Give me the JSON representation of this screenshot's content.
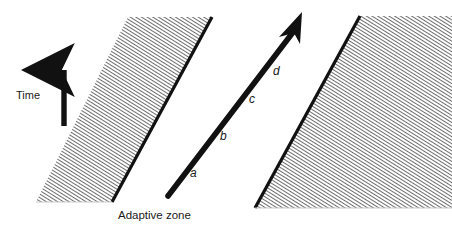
{
  "figure": {
    "background_color": "#ffffff",
    "ink_color": "#1a1a1a",
    "hatch_color": "#4d4d4d",
    "width": 452,
    "height": 233
  },
  "axis": {
    "time_label": "Time",
    "arrow_direction": "up"
  },
  "caption": {
    "adaptive_zone_label": "Adaptive zone"
  },
  "trajectory": {
    "arrow_direction": "up-right",
    "segments": [
      {
        "label": "a"
      },
      {
        "label": "b"
      },
      {
        "label": "c"
      },
      {
        "label": "d"
      }
    ]
  },
  "zones": [
    {
      "name": "left-hatched-band"
    },
    {
      "name": "right-hatched-band"
    }
  ]
}
